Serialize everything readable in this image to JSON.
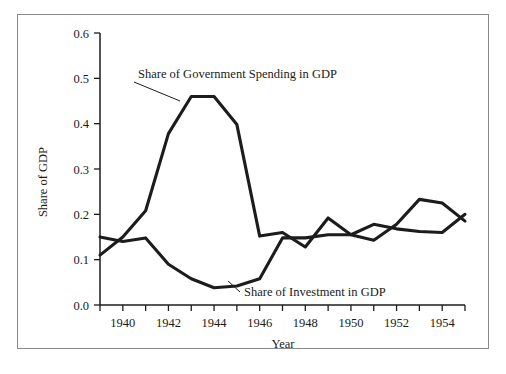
{
  "chart_data": {
    "type": "line",
    "title": "",
    "xlabel": "Year",
    "ylabel": "Share of GDP",
    "xlim": [
      1939,
      1955
    ],
    "ylim": [
      0.0,
      0.6
    ],
    "grid": false,
    "legend_position": "inline-annotations",
    "x": [
      1939,
      1940,
      1941,
      1942,
      1943,
      1944,
      1945,
      1946,
      1947,
      1948,
      1949,
      1950,
      1951,
      1952,
      1953,
      1954,
      1955
    ],
    "xticks": [
      1940,
      1942,
      1944,
      1946,
      1948,
      1950,
      1952,
      1954
    ],
    "xtick_labels": [
      "1940",
      "1942",
      "1944",
      "1946",
      "1948",
      "1950",
      "1952",
      "1954"
    ],
    "yticks": [
      0.0,
      0.1,
      0.2,
      0.3,
      0.4,
      0.5,
      0.6
    ],
    "ytick_labels": [
      "0.0",
      "0.1",
      "0.2",
      "0.3",
      "0.4",
      "0.5",
      "0.6"
    ],
    "series": [
      {
        "name": "Share of Government Spending in GDP",
        "color": "#1c1c1c",
        "values": [
          0.11,
          0.15,
          0.208,
          0.378,
          0.46,
          0.46,
          0.398,
          0.152,
          0.16,
          0.128,
          0.192,
          0.155,
          0.143,
          0.178,
          0.233,
          0.225,
          0.185
        ]
      },
      {
        "name": "Share of Investment in GDP",
        "color": "#1c1c1c",
        "values": [
          0.15,
          0.14,
          0.148,
          0.09,
          0.058,
          0.038,
          0.042,
          0.058,
          0.148,
          0.148,
          0.155,
          0.155,
          0.178,
          0.168,
          0.162,
          0.16,
          0.2
        ]
      }
    ],
    "annotations": [
      {
        "text": "Share of Government Spending in GDP",
        "anchor_year": 1942.6,
        "anchor_value": 0.455
      },
      {
        "text": "Share of Investment in GDP",
        "anchor_year": 1945.3,
        "anchor_value": 0.052
      }
    ]
  },
  "axis": {
    "y_label": "Share of GDP",
    "x_label": "Year",
    "y_ticks": [
      "0.6",
      "0.5",
      "0.4",
      "0.3",
      "0.2",
      "0.1",
      "0.0"
    ],
    "x_ticks": [
      "1940",
      "1942",
      "1944",
      "1946",
      "1948",
      "1950",
      "1952",
      "1954"
    ]
  },
  "annotations": {
    "government": "Share of Government Spending in GDP",
    "investment": "Share of Investment in GDP"
  },
  "colors": {
    "line": "#1c1c1c",
    "frame": "#8a8a8a",
    "background": "#ffffff",
    "text": "#1a1a1a"
  }
}
